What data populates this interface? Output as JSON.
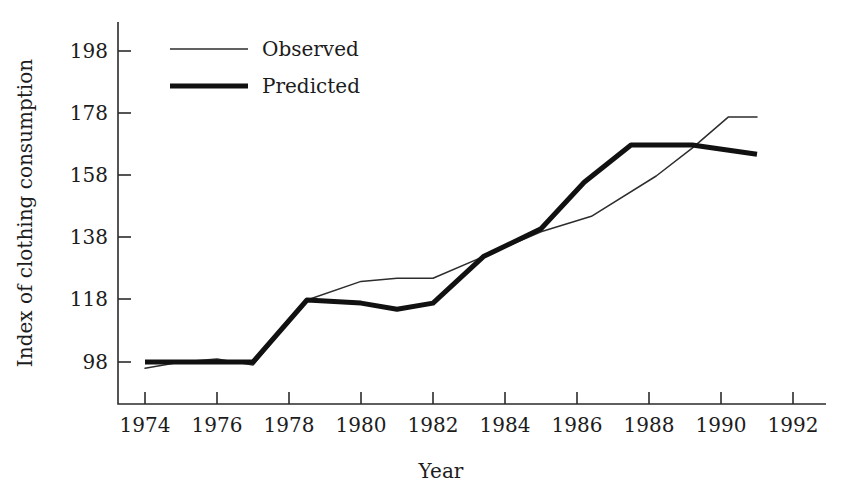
{
  "chart_data": {
    "type": "line",
    "title": "",
    "xlabel": "Year",
    "ylabel": "Index of clothing consumption",
    "xlim": [
      1973,
      1992.6
    ],
    "ylim": [
      88,
      205
    ],
    "xticks": [
      1974,
      1976,
      1978,
      1980,
      1982,
      1984,
      1986,
      1988,
      1990,
      1992
    ],
    "yticks": [
      98,
      118,
      138,
      158,
      178,
      198
    ],
    "grid": false,
    "legend_position": "top-left-inside",
    "series": [
      {
        "name": "Observed",
        "style": "thin",
        "x": [
          1974,
          1975,
          1976,
          1977,
          1978.5,
          1980,
          1981,
          1982,
          1983.4,
          1985,
          1986.4,
          1988.2,
          1989.2,
          1990.2,
          1991
        ],
        "values": [
          96,
          98,
          99,
          97,
          118,
          124,
          125,
          125,
          132,
          140,
          145,
          158,
          167,
          177,
          177
        ]
      },
      {
        "name": "Predicted",
        "style": "thick",
        "x": [
          1974,
          1975,
          1976,
          1977,
          1978.5,
          1980,
          1981,
          1982,
          1983.4,
          1985,
          1986.2,
          1987.5,
          1989.2,
          1991
        ],
        "values": [
          98,
          98,
          98,
          98,
          118,
          117,
          115,
          117,
          132,
          141,
          156,
          168,
          168,
          165
        ]
      }
    ]
  },
  "axis": {
    "x_title": "Year",
    "y_title": "Index of clothing consumption",
    "x_tick_labels": [
      "1974",
      "1976",
      "1978",
      "1980",
      "1982",
      "1984",
      "1986",
      "1988",
      "1990",
      "1992"
    ],
    "y_tick_labels": [
      "98",
      "118",
      "138",
      "158",
      "178",
      "198"
    ]
  },
  "legend": {
    "entries": [
      {
        "label": "Observed",
        "style": "thin"
      },
      {
        "label": "Predicted",
        "style": "thick"
      }
    ]
  },
  "colors": {
    "observed_line": "#2d2d2d",
    "predicted_line": "#111111",
    "axis": "#2b2b2b",
    "text": "#1c1c1c",
    "background": "#ffffff"
  }
}
